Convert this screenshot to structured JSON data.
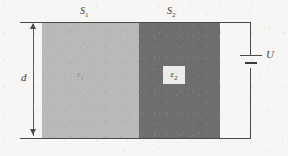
{
  "figure": {
    "type": "physics-circuit-diagram"
  },
  "labels": {
    "area_1": "S",
    "area_1_sub": "1",
    "area_2": "S",
    "area_2_sub": "2",
    "separation": "d",
    "voltage": "U",
    "permittivity_1": "ε",
    "permittivity_1_sub": "1",
    "permittivity_2": "ε",
    "permittivity_2_sub": "2"
  },
  "icons": {
    "battery": "battery-cell-icon",
    "dimension_arrow": "double-headed-arrow-icon",
    "plate_top": "capacitor-plate-icon",
    "plate_bottom": "capacitor-plate-icon"
  },
  "colors": {
    "background": "#f7f6f4",
    "dielectric_1": "#b9b9b7",
    "dielectric_2": "#6e6e6e",
    "line": "#4a4a48",
    "label_text": "#3c3c3a",
    "eps1_text": "#8a8a86",
    "eps2_box": "#ececea"
  }
}
